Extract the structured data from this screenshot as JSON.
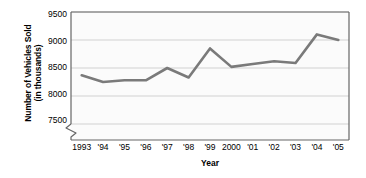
{
  "chart_data": {
    "type": "line",
    "title": "",
    "xlabel": "Year",
    "ylabel": "Number of Vehicles Sold (in thousands)",
    "ylabel_lines": [
      "Number of Vehicles Sold",
      "(in thousands)"
    ],
    "categories": [
      "1993",
      "'94",
      "'95",
      "'96",
      "'97",
      "'98",
      "'99",
      "2000",
      "'01",
      "'02",
      "'03",
      "'04",
      "'05"
    ],
    "x": [
      1993,
      1994,
      1995,
      1996,
      1997,
      1998,
      1999,
      2000,
      2001,
      2002,
      2003,
      2004,
      2005
    ],
    "values": [
      8370,
      8250,
      8280,
      8280,
      8500,
      8330,
      8850,
      8520,
      8570,
      8620,
      8590,
      9100,
      9000
    ],
    "series": [
      {
        "name": "Number of Vehicles Sold",
        "values": [
          8370,
          8250,
          8280,
          8280,
          8500,
          8330,
          8850,
          8520,
          8570,
          8620,
          8590,
          9100,
          9000
        ]
      }
    ],
    "ylim": [
      7500,
      9500
    ],
    "yticks": [
      7500,
      8000,
      8500,
      9000,
      9500
    ],
    "ytick_labels": [
      "7500",
      "8000",
      "8500",
      "9000",
      "9500"
    ],
    "y_axis_break": true,
    "grid": "horizontal",
    "legend": "none",
    "line_color": "#7a7a7a",
    "grid_color": "#cccccc",
    "axis_color": "#555555",
    "background_color": "#fbfbfb"
  }
}
